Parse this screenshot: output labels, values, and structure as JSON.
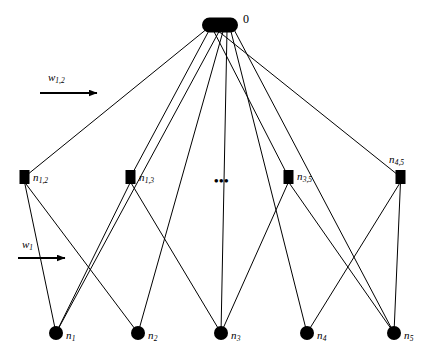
{
  "figure": {
    "background_color": "#ffffff",
    "ink_color": "#000000",
    "width": 444,
    "height": 364
  },
  "root": {
    "id": "root",
    "shape": "rounded-rect",
    "label": "0",
    "label_x": 243,
    "label_y": 13,
    "cx": 220,
    "cy": 25,
    "rx": 18,
    "ry": 7.5
  },
  "ellipsis": {
    "text": "•••",
    "x": 214,
    "y": 174
  },
  "factor_nodes": [
    {
      "id": "n12",
      "label_base": "n",
      "label_sub": "1,2",
      "cx": 24.5,
      "cy": 177,
      "w": 10,
      "h": 14,
      "label_x": 33,
      "label_y": 172
    },
    {
      "id": "n13",
      "label_base": "n",
      "label_sub": "1,3",
      "cx": 130.5,
      "cy": 177,
      "w": 10,
      "h": 14,
      "label_x": 139,
      "label_y": 172
    },
    {
      "id": "n35",
      "label_base": "n",
      "label_sub": "3,5",
      "cx": 288.5,
      "cy": 177,
      "w": 10,
      "h": 14,
      "label_x": 297,
      "label_y": 171
    },
    {
      "id": "n45",
      "label_base": "n",
      "label_sub": "4,5",
      "cx": 400.5,
      "cy": 177,
      "w": 10,
      "h": 14,
      "label_x": 389,
      "label_y": 154
    }
  ],
  "variable_nodes": [
    {
      "id": "n1",
      "label_base": "n",
      "label_sub": "1",
      "cx": 56,
      "cy": 333,
      "r": 7,
      "label_x": 66,
      "label_y": 330
    },
    {
      "id": "n2",
      "label_base": "n",
      "label_sub": "2",
      "cx": 138,
      "cy": 333,
      "r": 7,
      "label_x": 148,
      "label_y": 330
    },
    {
      "id": "n3",
      "label_base": "n",
      "label_sub": "3",
      "cx": 221,
      "cy": 333,
      "r": 7,
      "label_x": 231,
      "label_y": 330
    },
    {
      "id": "n4",
      "label_base": "n",
      "label_sub": "4",
      "cx": 307,
      "cy": 333,
      "r": 7,
      "label_x": 317,
      "label_y": 330
    },
    {
      "id": "n5",
      "label_base": "n",
      "label_sub": "5",
      "cx": 394,
      "cy": 333,
      "r": 7,
      "label_x": 404,
      "label_y": 330
    }
  ],
  "root_edges": [
    {
      "from": "root",
      "to": "n12"
    },
    {
      "from": "root",
      "to": "n13"
    },
    {
      "from": "root",
      "to": "n35"
    },
    {
      "from": "root",
      "to": "n45"
    },
    {
      "from": "root",
      "to": "n1"
    },
    {
      "from": "root",
      "to": "n2"
    },
    {
      "from": "root",
      "to": "n3"
    },
    {
      "from": "root",
      "to": "n4"
    },
    {
      "from": "root",
      "to": "n5"
    }
  ],
  "factor_edges": [
    {
      "from": "n12",
      "to": "n1"
    },
    {
      "from": "n12",
      "to": "n2"
    },
    {
      "from": "n13",
      "to": "n1"
    },
    {
      "from": "n13",
      "to": "n3"
    },
    {
      "from": "n35",
      "to": "n3"
    },
    {
      "from": "n35",
      "to": "n5"
    },
    {
      "from": "n45",
      "to": "n4"
    },
    {
      "from": "n45",
      "to": "n5"
    }
  ],
  "annotations": [
    {
      "id": "w12",
      "label_base": "w",
      "label_sub": "1,2",
      "label_x": 48,
      "label_y": 72,
      "arrow": {
        "x1": 40,
        "y1": 93,
        "x2": 106,
        "y2": 93
      }
    },
    {
      "id": "w1",
      "label_base": "w",
      "label_sub": "1",
      "label_x": 22,
      "label_y": 239,
      "arrow": {
        "x1": 18,
        "y1": 258,
        "x2": 74,
        "y2": 258
      }
    }
  ]
}
